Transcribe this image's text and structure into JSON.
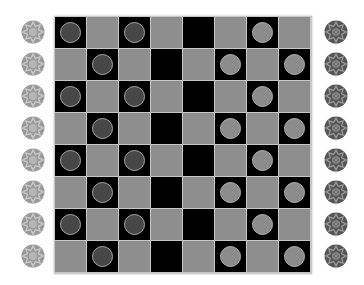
{
  "game": "checkers",
  "colors": {
    "light_square": "#8e8e8e",
    "dark_square": "#000000",
    "grid_line": "#c8c8c8",
    "dark_piece": "#474747",
    "light_piece": "#8c8c8c",
    "left_token": "#9a9a9a",
    "right_token": "#555555"
  },
  "board": {
    "rows": 8,
    "cols": 8,
    "cells": [
      [
        "D",
        "L",
        "D",
        "L",
        "E",
        "L",
        "W",
        "L"
      ],
      [
        "L",
        "D",
        "L",
        "E",
        "L",
        "W",
        "L",
        "W"
      ],
      [
        "D",
        "L",
        "D",
        "L",
        "E",
        "L",
        "W",
        "L"
      ],
      [
        "L",
        "D",
        "L",
        "E",
        "L",
        "W",
        "L",
        "W"
      ],
      [
        "D",
        "L",
        "D",
        "L",
        "E",
        "L",
        "W",
        "L"
      ],
      [
        "L",
        "D",
        "L",
        "E",
        "L",
        "W",
        "L",
        "W"
      ],
      [
        "D",
        "L",
        "D",
        "L",
        "E",
        "L",
        "W",
        "L"
      ],
      [
        "L",
        "D",
        "L",
        "E",
        "L",
        "W",
        "L",
        "W"
      ]
    ],
    "legend": {
      "L": "light square, empty",
      "E": "dark square, empty",
      "D": "dark square, dark piece",
      "W": "dark square, light piece"
    }
  },
  "left_reserve": {
    "count": 8,
    "icon": "star-token-icon",
    "shade": "light"
  },
  "right_reserve": {
    "count": 8,
    "icon": "star-token-icon",
    "shade": "dark"
  }
}
